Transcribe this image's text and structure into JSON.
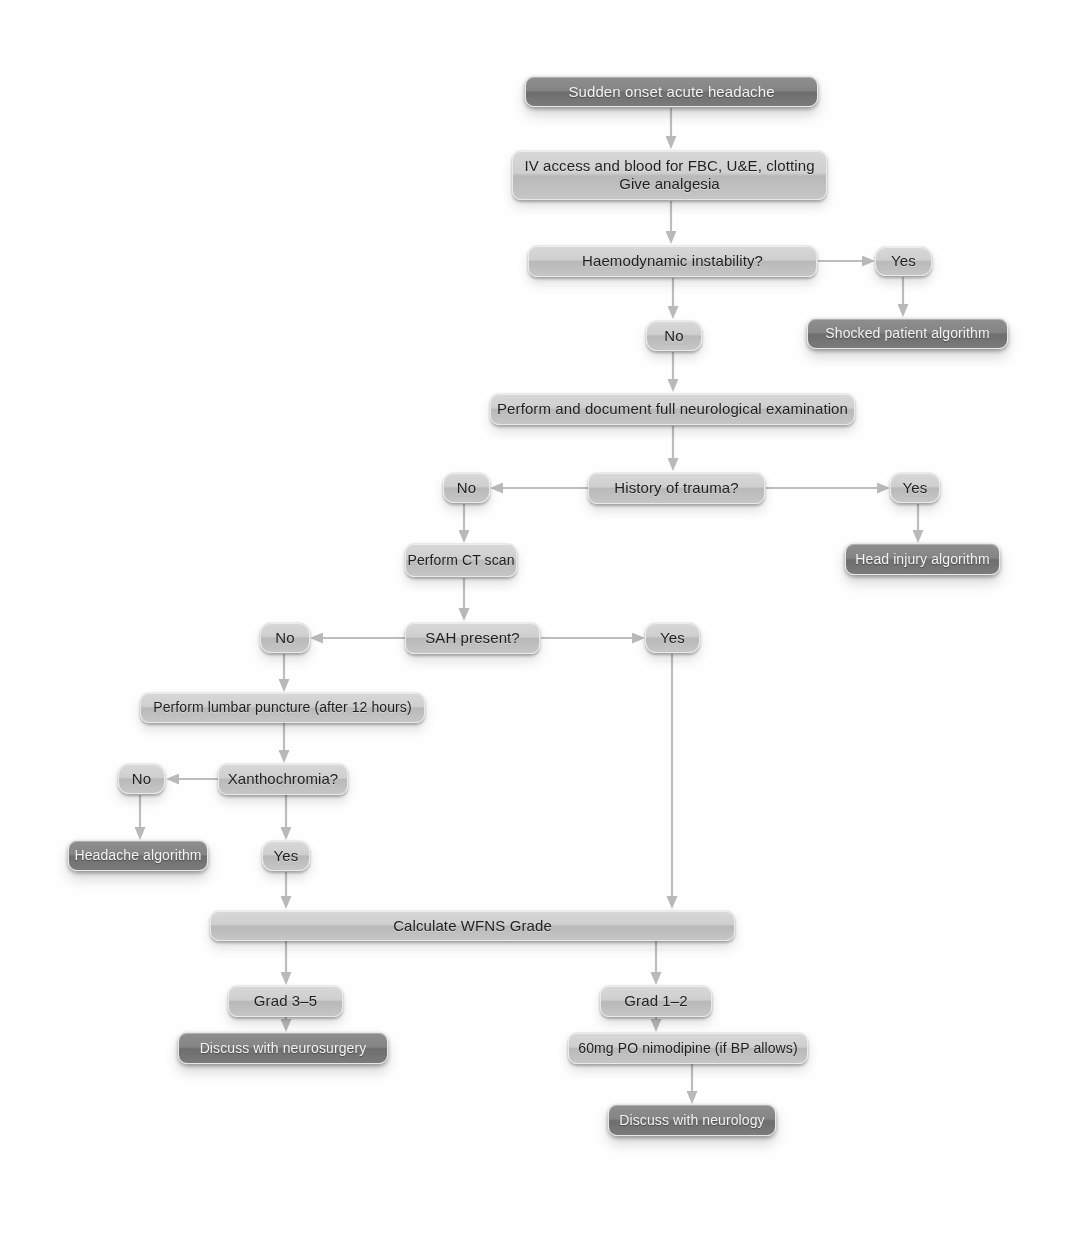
{
  "diagram": {
    "type": "clinical-decision-flowchart",
    "colors": {
      "background": "#fefefe",
      "light_box_fill": "#cbcbcb",
      "dark_box_fill": "#7d7d7d",
      "light_box_text": "#1f1f1f",
      "dark_box_text": "#f4f4f4",
      "connector": "#b4b4b4"
    },
    "nodes": [
      {
        "id": "start",
        "label": "Sudden onset acute headache",
        "style": "dark",
        "x": 525,
        "y": 76,
        "w": 293,
        "h": 31
      },
      {
        "id": "iv",
        "label": "IV access and blood for FBC, U&E, clotting\nGive analgesia",
        "style": "light",
        "x": 512,
        "y": 150,
        "w": 315,
        "h": 50
      },
      {
        "id": "haemo",
        "label": "Haemodynamic instability?",
        "style": "light",
        "x": 528,
        "y": 245,
        "w": 289,
        "h": 32
      },
      {
        "id": "haemo-yes",
        "label": "Yes",
        "style": "light",
        "x": 875,
        "y": 246,
        "w": 57,
        "h": 30
      },
      {
        "id": "haemo-no",
        "label": "No",
        "style": "light",
        "x": 646,
        "y": 320,
        "w": 56,
        "h": 31
      },
      {
        "id": "shocked",
        "label": "Shocked patient algorithm",
        "style": "dark",
        "x": 807,
        "y": 318,
        "w": 201,
        "h": 31
      },
      {
        "id": "neuroexam",
        "label": "Perform and document full neurological examination",
        "style": "light",
        "x": 490,
        "y": 393,
        "w": 365,
        "h": 32
      },
      {
        "id": "trauma-no",
        "label": "No",
        "style": "light",
        "x": 443,
        "y": 472,
        "w": 47,
        "h": 31
      },
      {
        "id": "trauma",
        "label": "History of trauma?",
        "style": "light",
        "x": 588,
        "y": 472,
        "w": 177,
        "h": 32
      },
      {
        "id": "trauma-yes",
        "label": "Yes",
        "style": "light",
        "x": 890,
        "y": 472,
        "w": 50,
        "h": 31
      },
      {
        "id": "ct",
        "label": "Perform CT scan",
        "style": "light",
        "x": 405,
        "y": 543,
        "w": 112,
        "h": 34
      },
      {
        "id": "headinjury",
        "label": "Head injury algorithm",
        "style": "dark",
        "x": 845,
        "y": 543,
        "w": 155,
        "h": 32
      },
      {
        "id": "sah-no",
        "label": "No",
        "style": "light",
        "x": 260,
        "y": 622,
        "w": 50,
        "h": 31
      },
      {
        "id": "sah",
        "label": "SAH present?",
        "style": "light",
        "x": 405,
        "y": 622,
        "w": 135,
        "h": 32
      },
      {
        "id": "sah-yes",
        "label": "Yes",
        "style": "light",
        "x": 645,
        "y": 622,
        "w": 55,
        "h": 31
      },
      {
        "id": "lp",
        "label": "Perform lumbar puncture (after 12 hours)",
        "style": "light",
        "x": 140,
        "y": 692,
        "w": 285,
        "h": 31
      },
      {
        "id": "xantho-no",
        "label": "No",
        "style": "light",
        "x": 118,
        "y": 763,
        "w": 47,
        "h": 31
      },
      {
        "id": "xantho",
        "label": "Xanthochromia?",
        "style": "light",
        "x": 218,
        "y": 763,
        "w": 130,
        "h": 32
      },
      {
        "id": "headache-alg",
        "label": "Headache algorithm",
        "style": "dark",
        "x": 68,
        "y": 840,
        "w": 140,
        "h": 31
      },
      {
        "id": "xantho-yes",
        "label": "Yes",
        "style": "light",
        "x": 262,
        "y": 840,
        "w": 48,
        "h": 31
      },
      {
        "id": "wfns",
        "label": "Calculate WFNS Grade",
        "style": "light",
        "x": 210,
        "y": 910,
        "w": 525,
        "h": 31
      },
      {
        "id": "grade35",
        "label": "Grad 3–5",
        "style": "light",
        "x": 228,
        "y": 985,
        "w": 115,
        "h": 32
      },
      {
        "id": "grade12",
        "label": "Grad 1–2",
        "style": "light",
        "x": 600,
        "y": 985,
        "w": 112,
        "h": 32
      },
      {
        "id": "neurosurgery",
        "label": "Discuss with neurosurgery",
        "style": "dark",
        "x": 178,
        "y": 1032,
        "w": 210,
        "h": 32
      },
      {
        "id": "nimodipine",
        "label": "60mg PO nimodipine (if BP allows)",
        "style": "light",
        "x": 568,
        "y": 1032,
        "w": 240,
        "h": 32
      },
      {
        "id": "neurology",
        "label": "Discuss with neurology",
        "style": "dark",
        "x": 608,
        "y": 1104,
        "w": 168,
        "h": 32
      }
    ],
    "edges": [
      {
        "from": "start",
        "to": "iv",
        "label": ""
      },
      {
        "from": "iv",
        "to": "haemo",
        "label": ""
      },
      {
        "from": "haemo",
        "to": "haemo-yes",
        "label": "Yes"
      },
      {
        "from": "haemo",
        "to": "haemo-no",
        "label": "No"
      },
      {
        "from": "haemo-yes",
        "to": "shocked",
        "label": ""
      },
      {
        "from": "haemo-no",
        "to": "neuroexam",
        "label": ""
      },
      {
        "from": "neuroexam",
        "to": "trauma",
        "label": ""
      },
      {
        "from": "trauma",
        "to": "trauma-no",
        "label": "No"
      },
      {
        "from": "trauma",
        "to": "trauma-yes",
        "label": "Yes"
      },
      {
        "from": "trauma-no",
        "to": "ct",
        "label": ""
      },
      {
        "from": "trauma-yes",
        "to": "headinjury",
        "label": ""
      },
      {
        "from": "ct",
        "to": "sah",
        "label": ""
      },
      {
        "from": "sah",
        "to": "sah-no",
        "label": "No"
      },
      {
        "from": "sah",
        "to": "sah-yes",
        "label": "Yes"
      },
      {
        "from": "sah-no",
        "to": "lp",
        "label": ""
      },
      {
        "from": "sah-yes",
        "to": "wfns",
        "label": ""
      },
      {
        "from": "lp",
        "to": "xantho",
        "label": ""
      },
      {
        "from": "xantho",
        "to": "xantho-no",
        "label": "No"
      },
      {
        "from": "xantho",
        "to": "xantho-yes",
        "label": "Yes"
      },
      {
        "from": "xantho-no",
        "to": "headache-alg",
        "label": ""
      },
      {
        "from": "xantho-yes",
        "to": "wfns",
        "label": ""
      },
      {
        "from": "wfns",
        "to": "grade35",
        "label": ""
      },
      {
        "from": "wfns",
        "to": "grade12",
        "label": ""
      },
      {
        "from": "grade35",
        "to": "neurosurgery",
        "label": ""
      },
      {
        "from": "grade12",
        "to": "nimodipine",
        "label": ""
      },
      {
        "from": "nimodipine",
        "to": "neurology",
        "label": ""
      }
    ]
  }
}
